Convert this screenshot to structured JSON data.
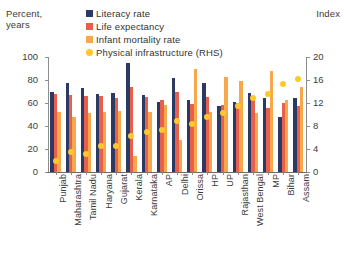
{
  "axes": {
    "left_caption": "Percent,\nyears",
    "right_caption": "Index",
    "left_ticks": [
      "100",
      "80",
      "60",
      "40",
      "20",
      "0"
    ],
    "right_ticks": [
      "20",
      "16",
      "12",
      "8",
      "4",
      "0"
    ]
  },
  "legend": {
    "items": [
      {
        "label": "Literacy rate",
        "color": "#2b3a63",
        "shape": "square"
      },
      {
        "label": "Life expectancy",
        "color": "#e8604c",
        "shape": "square"
      },
      {
        "label": "Infant mortality rate",
        "color": "#f7a84b",
        "shape": "square"
      },
      {
        "label": "Physical infrastructure (RHS)",
        "color": "#fdc82a",
        "shape": "dot"
      }
    ]
  },
  "chart_data": {
    "type": "bar",
    "title": "",
    "xlabel": "",
    "ylabel": "Percent, years",
    "y2label": "Index",
    "ylim": [
      0,
      100
    ],
    "y2lim": [
      0,
      20
    ],
    "grid": false,
    "legend_position": "top",
    "categories": [
      "Punjab",
      "Maharashtra",
      "Tamil Nadu",
      "Haryana",
      "Gujarat",
      "Kerala",
      "Karnataka",
      "AP",
      "Delhi",
      "Orissa",
      "HP",
      "UP",
      "Rajasthan",
      "West Bengal",
      "MP",
      "Bihar",
      "Assam"
    ],
    "series": [
      {
        "name": "Literacy rate",
        "axis": "left",
        "color": "#2b3a63",
        "values": [
          70,
          77,
          73,
          68,
          69,
          95,
          67,
          61,
          82,
          63,
          77,
          57,
          61,
          69,
          64,
          48,
          64
        ]
      },
      {
        "name": "Life expectancy",
        "axis": "left",
        "color": "#e8604c",
        "values": [
          68,
          67,
          66,
          66,
          64,
          74,
          65,
          63,
          70,
          59,
          65,
          58,
          60,
          64,
          56,
          60,
          57
        ]
      },
      {
        "name": "Infant mortality rate",
        "axis": "left",
        "color": "#f7a84b",
        "values": [
          52,
          48,
          51,
          52,
          53,
          14,
          52,
          58,
          28,
          90,
          52,
          83,
          79,
          51,
          88,
          63,
          74
        ]
      },
      {
        "name": "Physical infrastructure (RHS)",
        "axis": "right",
        "color": "#fdc82a",
        "values": [
          2.0,
          3.5,
          3.2,
          4.6,
          4.5,
          6.3,
          7.0,
          7.3,
          8.8,
          8.3,
          9.6,
          10.3,
          11.4,
          12.8,
          13.6,
          15.3,
          16.1
        ]
      }
    ]
  }
}
